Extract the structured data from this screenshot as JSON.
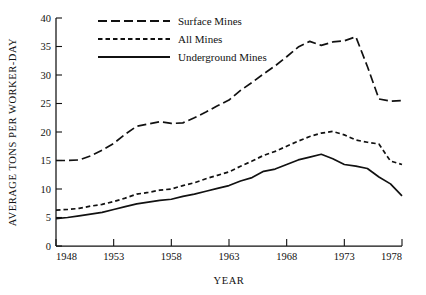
{
  "chart_data": {
    "type": "line",
    "title": "",
    "xlabel": "YEAR",
    "ylabel": "AVERAGE TONS PER WORKER-DAY",
    "xlim": [
      1948,
      1978
    ],
    "ylim": [
      0,
      40
    ],
    "ytick_step": 5,
    "xtick_step": 5,
    "grid": false,
    "legend_position": "top-left",
    "x": [
      1948,
      1949,
      1950,
      1951,
      1952,
      1953,
      1954,
      1955,
      1956,
      1957,
      1958,
      1959,
      1960,
      1961,
      1962,
      1963,
      1964,
      1965,
      1966,
      1967,
      1968,
      1969,
      1970,
      1971,
      1972,
      1973,
      1974,
      1975,
      1976,
      1977,
      1978
    ],
    "xticks": [
      1948,
      1953,
      1958,
      1963,
      1968,
      1973,
      1978
    ],
    "xtick_labels": [
      "1948",
      "1953",
      "1958",
      "1963",
      "1968",
      "1973",
      "1978"
    ],
    "yticks": [
      0,
      5,
      10,
      15,
      20,
      25,
      30,
      35,
      40
    ],
    "ytick_labels": [
      "0",
      "5",
      "10",
      "15",
      "20",
      "25",
      "30",
      "35",
      "40"
    ],
    "series": [
      {
        "name": "Surface Mines",
        "linestyle": "long-dash",
        "dasharray": "9,4",
        "color": "#111111",
        "values": [
          15.0,
          15.0,
          15.1,
          15.8,
          16.8,
          18.0,
          19.6,
          21.0,
          21.4,
          21.8,
          21.5,
          21.6,
          22.5,
          23.5,
          24.6,
          25.6,
          27.3,
          28.7,
          30.2,
          31.6,
          33.2,
          34.9,
          35.9,
          35.2,
          35.8,
          36.0,
          36.7,
          31.5,
          25.8,
          25.4,
          25.5
        ]
      },
      {
        "name": "All Mines",
        "linestyle": "short-dash",
        "dasharray": "4.5,3",
        "color": "#111111",
        "values": [
          6.3,
          6.4,
          6.6,
          7.0,
          7.3,
          7.8,
          8.4,
          9.1,
          9.4,
          9.8,
          10.0,
          10.6,
          11.1,
          11.8,
          12.4,
          13.0,
          14.0,
          14.9,
          15.9,
          16.6,
          17.5,
          18.4,
          19.2,
          19.8,
          20.1,
          19.5,
          18.6,
          18.2,
          17.9,
          14.9,
          14.3
        ]
      },
      {
        "name": "Underground Mines",
        "linestyle": "solid",
        "dasharray": "",
        "color": "#111111",
        "values": [
          4.8,
          5.0,
          5.3,
          5.6,
          5.9,
          6.4,
          6.9,
          7.4,
          7.7,
          8.0,
          8.2,
          8.7,
          9.1,
          9.6,
          10.1,
          10.6,
          11.4,
          12.0,
          13.1,
          13.5,
          14.3,
          15.1,
          15.6,
          16.1,
          15.3,
          14.3,
          14.0,
          13.6,
          12.1,
          10.9,
          8.8
        ]
      }
    ]
  },
  "legend": {
    "items": [
      {
        "label": "Surface Mines"
      },
      {
        "label": "All Mines"
      },
      {
        "label": "Underground Mines"
      }
    ]
  }
}
